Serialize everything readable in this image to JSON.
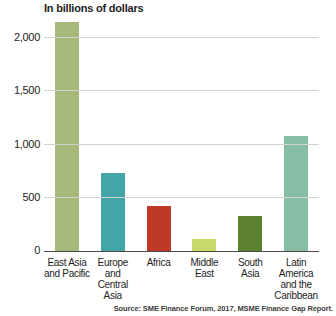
{
  "chart_data": {
    "type": "bar",
    "title": "In billions of dollars",
    "categories": [
      "East Asia\nand Pacific",
      "Europe\nand\nCentral Asia",
      "Africa",
      "Middle\nEast",
      "South\nAsia",
      "Latin\nAmerica\nand the\nCaribbean"
    ],
    "values": [
      2150,
      730,
      420,
      110,
      330,
      1080
    ],
    "bar_colors": [
      "#a6b97b",
      "#44a5a8",
      "#bf3a26",
      "#c8d96e",
      "#5c8130",
      "#87bda5"
    ],
    "xlabel": "",
    "ylabel": "",
    "ylim": [
      0,
      2200
    ],
    "yticks": [
      0,
      500,
      1000,
      1500,
      2000
    ],
    "ytick_labels": [
      "0",
      "500",
      "1,000",
      "1,500",
      "2,000"
    ],
    "grid": true,
    "legend": "none",
    "source": "Source: SME Finance Forum, 2017, MSME Finance Gap Report.",
    "colors": {
      "gridline": "#d2d2d2",
      "axis": "#4a4a4a",
      "text": "#1e1e1e"
    }
  }
}
